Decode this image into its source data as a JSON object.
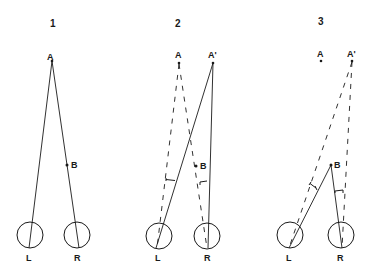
{
  "diagram": {
    "type": "binocular-vision-geometry",
    "panels": [
      {
        "number": "1",
        "points": {
          "A": "A",
          "B": "B"
        },
        "eyes": {
          "left": "L",
          "right": "R"
        }
      },
      {
        "number": "2",
        "points": {
          "A": "A",
          "A_prime": "A'",
          "B": "B"
        },
        "eyes": {
          "left": "L",
          "right": "R"
        }
      },
      {
        "number": "3",
        "points": {
          "A": "A",
          "A_prime": "A'",
          "B": "B"
        },
        "eyes": {
          "left": "L",
          "right": "R"
        }
      }
    ]
  },
  "colors": {
    "ink": "#1a1a1a",
    "background": "#ffffff"
  }
}
